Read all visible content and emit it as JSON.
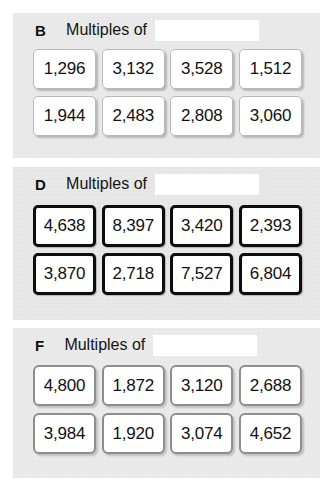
{
  "worksheet": {
    "blank_placeholder": "",
    "sections": [
      {
        "letter": "B",
        "title": "Multiples of",
        "border_style": "light-gray",
        "border_color": "#b9b9b9",
        "rows": [
          [
            "1,296",
            "3,132",
            "3,528",
            "1,512"
          ],
          [
            "1,944",
            "2,483",
            "2,808",
            "3,060"
          ]
        ]
      },
      {
        "letter": "D",
        "title": "Multiples of",
        "border_style": "thick-black",
        "border_color": "#0d0d0d",
        "rows": [
          [
            "4,638",
            "8,397",
            "3,420",
            "2,393"
          ],
          [
            "3,870",
            "2,718",
            "7,527",
            "6,804"
          ]
        ]
      },
      {
        "letter": "F",
        "title": "Multiples of",
        "border_style": "medium-gray",
        "border_color": "#8e8e8e",
        "rows": [
          [
            "4,800",
            "1,872",
            "3,120",
            "2,688"
          ],
          [
            "3,984",
            "1,920",
            "3,074",
            "4,652"
          ]
        ]
      }
    ]
  }
}
